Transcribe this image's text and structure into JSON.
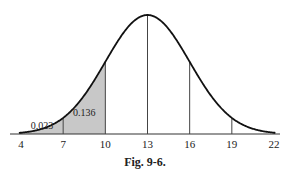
{
  "chart_data": {
    "type": "area",
    "title": "",
    "caption": "Fig. 9-6.",
    "distribution": "normal",
    "mean": 13,
    "sd": 3,
    "x_ticks": [
      4,
      7,
      10,
      13,
      16,
      19,
      22
    ],
    "xlim": [
      4,
      22
    ],
    "shaded_regions": [
      {
        "from": 4,
        "to": 7,
        "label": "0.023"
      },
      {
        "from": 7,
        "to": 10,
        "label": "0.136"
      }
    ],
    "vertical_lines_at": [
      4,
      7,
      10,
      13,
      16,
      19,
      22
    ],
    "colors": {
      "shade": "#c8c8c8",
      "curve": "#111111"
    },
    "grid": false,
    "xlabel": "",
    "ylabel": ""
  }
}
